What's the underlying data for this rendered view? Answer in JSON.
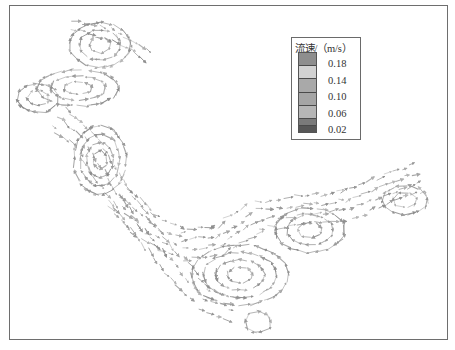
{
  "figure": {
    "type": "flow-velocity-vector-field",
    "frame_color": "#6e6e6e",
    "arrow_color": "#8a8a8a"
  },
  "legend": {
    "title": "流速/（m/s）",
    "ticks": [
      "0.18",
      "0.14",
      "0.10",
      "0.06",
      "0.02"
    ],
    "swatch_colors": [
      "#8e8e8e",
      "#d2d2d2",
      "#a9a9a9",
      "#a5a5a5",
      "#b6b6b6",
      "#7a7a7a",
      "#575757"
    ]
  },
  "vortices": [
    {
      "cx": 100,
      "cy": 45,
      "rx": 30,
      "ry": 22,
      "rings": 3,
      "dir": 1
    },
    {
      "cx": 78,
      "cy": 88,
      "rx": 40,
      "ry": 18,
      "rings": 3,
      "dir": -1
    },
    {
      "cx": 38,
      "cy": 98,
      "rx": 20,
      "ry": 14,
      "rings": 2,
      "dir": 1
    },
    {
      "cx": 100,
      "cy": 160,
      "rx": 26,
      "ry": 34,
      "rings": 4,
      "dir": 1
    },
    {
      "cx": 240,
      "cy": 275,
      "rx": 48,
      "ry": 30,
      "rings": 4,
      "dir": -1
    },
    {
      "cx": 310,
      "cy": 230,
      "rx": 34,
      "ry": 22,
      "rings": 3,
      "dir": 1
    },
    {
      "cx": 405,
      "cy": 200,
      "rx": 22,
      "ry": 14,
      "rings": 2,
      "dir": -1
    },
    {
      "cx": 258,
      "cy": 322,
      "rx": 12,
      "ry": 10,
      "rings": 1,
      "dir": 1
    }
  ],
  "channels": [
    {
      "points": [
        [
          120,
          200
        ],
        [
          150,
          230
        ],
        [
          185,
          245
        ],
        [
          220,
          240
        ],
        [
          260,
          215
        ],
        [
          300,
          210
        ],
        [
          350,
          205
        ],
        [
          385,
          190
        ],
        [
          425,
          175
        ]
      ],
      "width": 28,
      "rows": 4
    },
    {
      "points": [
        [
          60,
          120
        ],
        [
          85,
          140
        ],
        [
          115,
          190
        ],
        [
          140,
          225
        ],
        [
          170,
          260
        ],
        [
          205,
          300
        ],
        [
          240,
          312
        ]
      ],
      "width": 22,
      "rows": 3
    },
    {
      "points": [
        [
          75,
          25
        ],
        [
          110,
          35
        ],
        [
          140,
          50
        ],
        [
          152,
          58
        ]
      ],
      "width": 10,
      "rows": 2
    }
  ]
}
